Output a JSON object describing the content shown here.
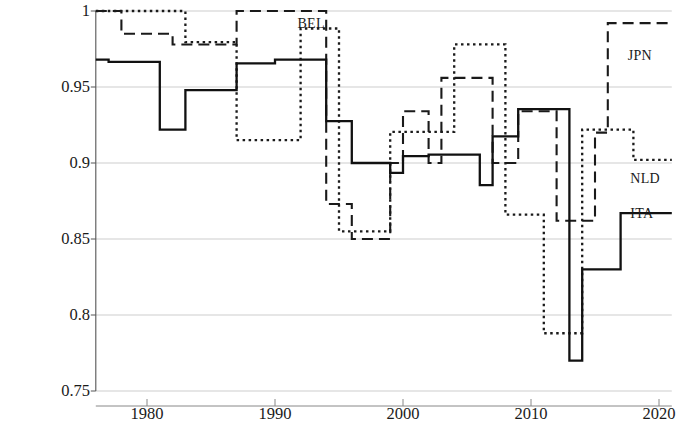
{
  "chart_data": {
    "type": "line",
    "title": "",
    "xlabel": "",
    "ylabel": "Congruence",
    "xlim": [
      1976,
      2021
    ],
    "ylim": [
      0.75,
      1.0
    ],
    "xticks": [
      1980,
      1990,
      2000,
      2010,
      2020
    ],
    "yticks": [
      0.75,
      0.8,
      0.85,
      0.9,
      0.95,
      1
    ],
    "ytick_labels": [
      "0.75",
      "0.8",
      "0.85",
      "0.9",
      "0.95",
      "1"
    ],
    "xtick_labels": [
      "1980",
      "1990",
      "2000",
      "2010",
      "2020"
    ],
    "grid": true,
    "grid_axis": "y",
    "step_type": "post",
    "legend": "inline-annotations",
    "series": [
      {
        "name": "BEL",
        "label": "BEL",
        "style": "dashed",
        "dash": "11,6",
        "color": "#1a1a1a",
        "width": 2.1,
        "label_x": 1991.6,
        "label_y": 0.9955,
        "x": [
          1976,
          1977,
          1978,
          1979,
          1980,
          1981,
          1982,
          1983,
          1984,
          1985,
          1986,
          1987,
          1988,
          1989,
          1990,
          1991,
          1992,
          1993,
          1994,
          1995,
          1996,
          1997,
          1998,
          1999,
          2000,
          2001,
          2002,
          2003,
          2004,
          2005,
          2006,
          2007,
          2008,
          2009,
          2010,
          2011,
          2012,
          2013,
          2014,
          2015,
          2016,
          2017,
          2018,
          2019,
          2020,
          2021
        ],
        "y": [
          1.0,
          1.0,
          0.985,
          0.985,
          0.985,
          0.985,
          0.978,
          0.978,
          0.978,
          0.978,
          0.978,
          1.0,
          1.0,
          1.0,
          1.0,
          1.0,
          1.0,
          1.0,
          0.873,
          0.873,
          0.85,
          0.85,
          0.85,
          0.9,
          0.934,
          0.934,
          0.9,
          0.956,
          0.956,
          0.956,
          0.956,
          0.9,
          0.9,
          0.934,
          0.934,
          0.934,
          0.862,
          0.862,
          0.862,
          0.92,
          0.992,
          0.992,
          0.992,
          0.992,
          0.992,
          0.992
        ]
      },
      {
        "name": "JPN",
        "label": "JPN",
        "style": "dashed-same-as-BEL",
        "label_x": 2017.4,
        "label_y": 0.9705,
        "note": "JPN labels the right-hand end of the long-dashed series"
      },
      {
        "name": "NLD",
        "label": "NLD",
        "style": "dotted",
        "dash": "2.5,3.5",
        "color": "#1a1a1a",
        "width": 2.3,
        "label_x": 2017.6,
        "label_y": 0.8895,
        "x": [
          1976,
          1977,
          1978,
          1979,
          1980,
          1981,
          1982,
          1983,
          1984,
          1985,
          1986,
          1987,
          1988,
          1989,
          1990,
          1991,
          1992,
          1993,
          1994,
          1995,
          1996,
          1997,
          1998,
          1999,
          2000,
          2001,
          2002,
          2003,
          2004,
          2005,
          2006,
          2007,
          2008,
          2009,
          2010,
          2011,
          2012,
          2013,
          2014,
          2015,
          2016,
          2017,
          2018,
          2019,
          2020,
          2021
        ],
        "y": [
          1.0,
          1.0,
          1.0,
          1.0,
          1.0,
          1.0,
          1.0,
          0.9795,
          0.9795,
          0.9795,
          0.9795,
          0.915,
          0.915,
          0.915,
          0.915,
          0.915,
          0.9885,
          0.9885,
          0.9885,
          0.855,
          0.855,
          0.855,
          0.855,
          0.9205,
          0.9205,
          0.9205,
          0.9205,
          0.9205,
          0.978,
          0.978,
          0.978,
          0.978,
          0.866,
          0.866,
          0.866,
          0.788,
          0.788,
          0.788,
          0.922,
          0.922,
          0.922,
          0.922,
          0.902,
          0.902,
          0.902,
          0.902
        ]
      },
      {
        "name": "ITA",
        "label": "ITA",
        "style": "solid",
        "dash": "",
        "color": "#111111",
        "width": 2.3,
        "label_x": 2017.6,
        "label_y": 0.8665,
        "x": [
          1976,
          1977,
          1978,
          1979,
          1980,
          1981,
          1982,
          1983,
          1984,
          1985,
          1986,
          1987,
          1988,
          1989,
          1990,
          1991,
          1992,
          1993,
          1994,
          1995,
          1996,
          1997,
          1998,
          1999,
          2000,
          2001,
          2002,
          2003,
          2004,
          2005,
          2006,
          2007,
          2008,
          2009,
          2010,
          2011,
          2012,
          2013,
          2014,
          2015,
          2016,
          2017,
          2018,
          2019,
          2020,
          2021
        ],
        "y": [
          0.968,
          0.9665,
          0.9665,
          0.9665,
          0.9665,
          0.922,
          0.922,
          0.948,
          0.948,
          0.948,
          0.948,
          0.9655,
          0.9655,
          0.9655,
          0.968,
          0.968,
          0.968,
          0.968,
          0.9275,
          0.9275,
          0.9,
          0.9,
          0.9,
          0.8935,
          0.9045,
          0.9045,
          0.9055,
          0.9055,
          0.9055,
          0.9055,
          0.8855,
          0.9175,
          0.9175,
          0.9355,
          0.9355,
          0.9355,
          0.9355,
          0.77,
          0.83,
          0.83,
          0.83,
          0.867,
          0.867,
          0.867,
          0.867,
          0.867
        ]
      }
    ]
  },
  "axis": {
    "y_title": "Congruence"
  }
}
